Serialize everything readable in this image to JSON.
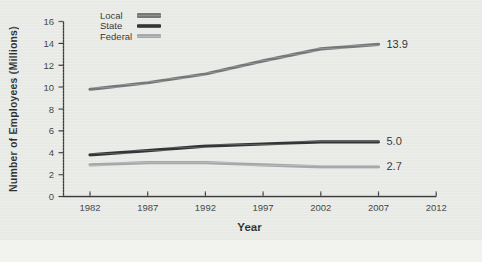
{
  "figure": {
    "page_background": "#f2f3ef",
    "panel_background": "#e8eae6",
    "axis_color": "#3a3b3d",
    "text_color": "#2e2f31"
  },
  "chart_data": {
    "type": "line",
    "title": "",
    "xlabel": "Year",
    "ylabel": "Number of Employees (Millions)",
    "x": [
      1982,
      1987,
      1992,
      1997,
      2002,
      2007
    ],
    "x_tick_labels": [
      "1982",
      "1987",
      "1992",
      "1997",
      "2002",
      "2007",
      "2012"
    ],
    "x_ticks": [
      1982,
      1987,
      1992,
      1997,
      2002,
      2007,
      2012
    ],
    "y_ticks": [
      0,
      2,
      4,
      6,
      8,
      10,
      12,
      14,
      16
    ],
    "xlim": [
      1979.5,
      2012
    ],
    "ylim": [
      0,
      16
    ],
    "grid": false,
    "legend_position": "top-left",
    "series": [
      {
        "name": "Local",
        "color": "#767779",
        "values": [
          9.8,
          10.4,
          11.2,
          12.4,
          13.5,
          13.9
        ],
        "end_label": "13.9"
      },
      {
        "name": "State",
        "color": "#333436",
        "values": [
          3.8,
          4.2,
          4.6,
          4.8,
          5.0,
          5.0
        ],
        "end_label": "5.0"
      },
      {
        "name": "Federal",
        "color": "#a6a8ab",
        "values": [
          2.9,
          3.1,
          3.1,
          2.9,
          2.7,
          2.7
        ],
        "end_label": "2.7"
      }
    ]
  }
}
